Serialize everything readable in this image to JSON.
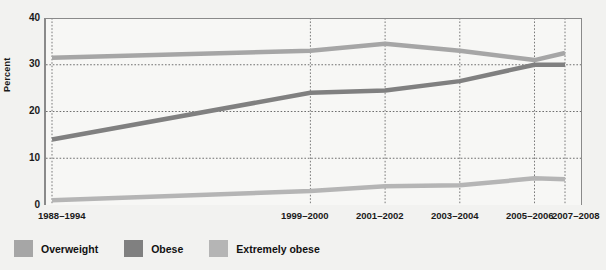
{
  "chart_data": {
    "type": "line",
    "title": "",
    "xlabel": "",
    "ylabel": "Percent",
    "ylim": [
      0,
      40
    ],
    "yticks": [
      0,
      10,
      20,
      30,
      40
    ],
    "categories": [
      "1988–1994",
      "1999–2000",
      "2001–2002",
      "2003–2004",
      "2005–2006",
      "2007–2008"
    ],
    "grid": true,
    "legend_position": "bottom-left",
    "series": [
      {
        "name": "Overweight",
        "color": "#a6a6a6",
        "values": [
          31.5,
          33.0,
          34.5,
          33.0,
          31.0,
          32.5
        ]
      },
      {
        "name": "Obese",
        "color": "#808080",
        "values": [
          14.0,
          24.0,
          24.5,
          26.5,
          30.0,
          30.0
        ]
      },
      {
        "name": "Extremely obese",
        "color": "#b5b5b5",
        "values": [
          1.0,
          3.0,
          4.0,
          4.2,
          5.7,
          5.5
        ]
      }
    ]
  },
  "axis": {
    "y_label": "Percent",
    "y_ticks": [
      "40",
      "30",
      "20",
      "10",
      "0"
    ],
    "x_ticks": [
      "1988–1994",
      "1999–2000",
      "2001–2002",
      "2003–2004",
      "2005–2006",
      "2007–2008"
    ]
  },
  "legend": {
    "items": [
      {
        "label": "Overweight",
        "color": "#a6a6a6"
      },
      {
        "label": "Obese",
        "color": "#808080"
      },
      {
        "label": "Extremely obese",
        "color": "#b5b5b5"
      }
    ]
  }
}
